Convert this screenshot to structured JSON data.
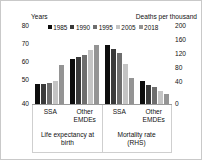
{
  "header": {
    "left_axis_title": "Years",
    "right_axis_title": "Deaths per thousand"
  },
  "legend": {
    "position": "top",
    "items": [
      {
        "label": "1985",
        "color": "#0d0d0d"
      },
      {
        "label": "1990",
        "color": "#3a3a3a"
      },
      {
        "label": "1995",
        "color": "#6e6e6e"
      },
      {
        "label": "2005",
        "color": "#c4c4c4"
      },
      {
        "label": "2018",
        "color": "#949494"
      }
    ]
  },
  "left_axis": {
    "label": "Years",
    "ticks": [
      "80",
      "70",
      "60",
      "50",
      "40"
    ],
    "min": 40,
    "max": 80
  },
  "right_axis": {
    "label": "Deaths per thousand",
    "ticks": [
      "200",
      "160",
      "120",
      "80",
      "40",
      "0"
    ],
    "min": 0,
    "max": 200
  },
  "categories": [
    {
      "line1": "SSA",
      "line2": ""
    },
    {
      "line1": "Other",
      "line2": "EMDEs"
    },
    {
      "line1": "SSA",
      "line2": ""
    },
    {
      "line1": "Other",
      "line2": "EMDEs"
    }
  ],
  "panels": [
    {
      "line1": "Life expectancy at",
      "line2": "birth"
    },
    {
      "line1": "Mortality rate",
      "line2": "(RHS)"
    }
  ],
  "chart_data": {
    "type": "bar",
    "title": "",
    "xlabel": "",
    "ylabel": "Years",
    "y2label": "Deaths per thousand",
    "ylim": [
      40,
      80
    ],
    "y2lim": [
      0,
      200
    ],
    "grid": false,
    "legend_position": "top",
    "categories": [
      "SSA (Life expectancy at birth)",
      "Other EMDEs (Life expectancy at birth)",
      "SSA (Mortality rate, RHS)",
      "Other EMDEs (Mortality rate, RHS)"
    ],
    "series": [
      {
        "name": "1985",
        "color": "#0d0d0d",
        "values": [
          51.0,
          65.0,
          165,
          63
        ]
      },
      {
        "name": "1990",
        "color": "#3a3a3a",
        "values": [
          51.0,
          66.0,
          152,
          53
        ]
      },
      {
        "name": "1995",
        "color": "#6e6e6e",
        "values": [
          51.5,
          67.0,
          143,
          46
        ]
      },
      {
        "name": "2005",
        "color": "#c4c4c4",
        "values": [
          53.0,
          70.0,
          110,
          35
        ]
      },
      {
        "name": "2018",
        "color": "#949494",
        "values": [
          61.5,
          72.5,
          72,
          27
        ]
      }
    ],
    "panel_axis_assignment": [
      {
        "panel": "Life expectancy at birth",
        "axis": "left",
        "units": "Years"
      },
      {
        "panel": "Mortality rate (RHS)",
        "axis": "right",
        "units": "Deaths per thousand"
      }
    ]
  }
}
